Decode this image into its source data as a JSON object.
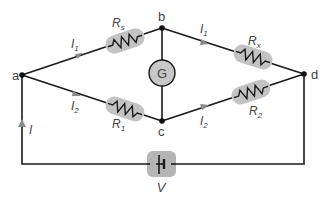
{
  "diagram": {
    "nodes": [
      {
        "id": "a",
        "label": "a",
        "x": 22,
        "y": 75
      },
      {
        "id": "b",
        "label": "b",
        "x": 162,
        "y": 28
      },
      {
        "id": "c",
        "label": "c",
        "x": 162,
        "y": 121
      },
      {
        "id": "d",
        "label": "d",
        "x": 304,
        "y": 74
      }
    ],
    "resistors": [
      {
        "id": "Rs",
        "label": "R",
        "sub": "s",
        "from": "a",
        "to": "b"
      },
      {
        "id": "Rx",
        "label": "R",
        "sub": "x",
        "from": "b",
        "to": "d"
      },
      {
        "id": "R1",
        "label": "R",
        "sub": "1",
        "from": "a",
        "to": "c"
      },
      {
        "id": "R2",
        "label": "R",
        "sub": "2",
        "from": "c",
        "to": "d"
      }
    ],
    "galvanometer": {
      "label": "G",
      "from": "b",
      "to": "c"
    },
    "battery": {
      "label": "V"
    },
    "currents": [
      {
        "label": "I",
        "sub": "1",
        "branch": "a-b"
      },
      {
        "label": "I",
        "sub": "1",
        "branch": "b-d"
      },
      {
        "label": "I",
        "sub": "2",
        "branch": "a-c"
      },
      {
        "label": "I",
        "sub": "2",
        "branch": "c-d"
      },
      {
        "label": "I",
        "sub": "",
        "branch": "source"
      }
    ],
    "colors": {
      "wire": "#1a1a1a",
      "component_pad": "#c3c3c3",
      "label": "#444444",
      "arrow": "#8a8a8a"
    }
  }
}
